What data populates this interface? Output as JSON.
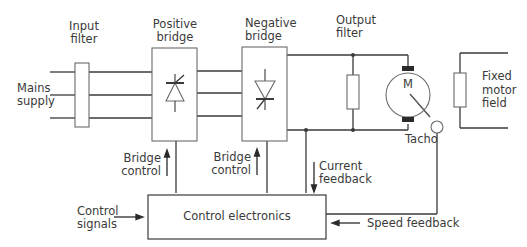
{
  "labels": {
    "input_filter": [
      "Input",
      "filter"
    ],
    "positive_bridge": [
      "Positive",
      "bridge"
    ],
    "negative_bridge": [
      "Negative",
      "bridge"
    ],
    "output_filter": [
      "Output",
      "filter"
    ],
    "mains_supply": [
      "Mains",
      "supply"
    ],
    "motor": "M",
    "fixed_motor_field": [
      "Fixed",
      "motor",
      "field"
    ],
    "tacho": "Tacho",
    "bridge_control_1": [
      "Bridge",
      "control"
    ],
    "bridge_control_2": [
      "Bridge",
      "control"
    ],
    "current_feedback": [
      "Current",
      "feedback"
    ],
    "control_signals": [
      "Control",
      "signals"
    ],
    "control_electronics": "Control electronics",
    "speed_feedback": "Speed feedback"
  },
  "colors": {
    "line": "#3a3a3a",
    "box_stroke": "#6a6a6a",
    "text": "#3a3a3a",
    "background": "#ffffff"
  }
}
